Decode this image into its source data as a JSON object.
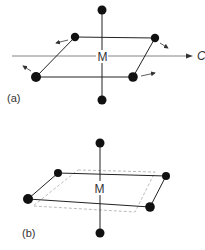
{
  "figure": {
    "colors": {
      "atom": "#111111",
      "bond": "#222222",
      "axis": "#555555",
      "dashed": "#aaaaaa",
      "text": "#333333"
    },
    "panel_a": {
      "label": "(a)",
      "center_label": "M",
      "axis_label": "C",
      "description": "Octahedral complex: square-planar equatorial ligands rotating about C axis with axial ligands above/below M",
      "rotation_arrows": 4
    },
    "panel_b": {
      "label": "(b)",
      "center_label": "M",
      "description": "Octahedral complex with distorted (twisted) equatorial plane; dashed outline shows original square plane"
    }
  }
}
